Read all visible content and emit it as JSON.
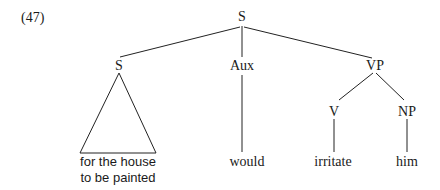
{
  "example_number": "(47)",
  "tree": {
    "root": {
      "label": "S"
    },
    "nodes": {
      "subject": {
        "label": "S"
      },
      "aux": {
        "label": "Aux"
      },
      "vp": {
        "label": "VP"
      },
      "v": {
        "label": "V"
      },
      "np": {
        "label": "NP"
      }
    },
    "leaves": {
      "subject_line1": "for the house",
      "subject_line2": "to be painted",
      "aux": "would",
      "v": "irritate",
      "np": "him"
    }
  }
}
